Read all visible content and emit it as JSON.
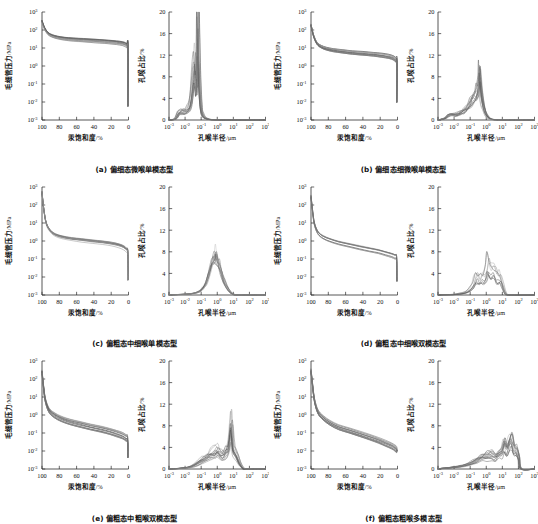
{
  "figure": {
    "panel_count": 6,
    "style": "grayscale multi-sample curves"
  },
  "axes": {
    "pc": {
      "ylabel": "毛细管压力",
      "yunit": "/MPa",
      "xlabel": "汞饱和度",
      "xunit": "/%",
      "y_ticks": [
        "10³",
        "10²",
        "10¹",
        "10⁰",
        "10⁻¹",
        "10⁻²",
        "10⁻³"
      ],
      "y_sup": [
        "3",
        "2",
        "1",
        "0",
        "-1",
        "-2",
        "-3"
      ],
      "x_ticks": [
        "100",
        "80",
        "60",
        "40",
        "20",
        "0"
      ],
      "ylim_log": [
        -3,
        3
      ],
      "xlim": [
        100,
        0
      ]
    },
    "psd": {
      "ylabel": "孔喉占比",
      "yunit": "/%",
      "xlabel": "孔喉半径",
      "xunit": "/μm",
      "y_ticks": [
        "20",
        "16",
        "12",
        "8",
        "4",
        "0"
      ],
      "x_ticks": [
        "10⁻³",
        "10⁻²",
        "10⁻¹",
        "10⁰",
        "10¹",
        "10²",
        "10³"
      ],
      "x_sup": [
        "-3",
        "-2",
        "-1",
        "0",
        "1",
        "2",
        "3"
      ],
      "ylim": [
        0,
        20
      ],
      "xlim_log": [
        -3,
        3
      ]
    }
  },
  "colors": {
    "axis": "#2b2b2b",
    "curve_dark": "#4a4a4a",
    "curve_mid": "#777777",
    "curve_light": "#a6a6a6",
    "background": "#ffffff"
  },
  "panels": [
    {
      "id": "a",
      "caption": "(a) 偏细态微喉单模态型",
      "chart_data": {
        "type": "line",
        "title": "(a) 偏细态微喉单模态型",
        "subcharts": [
          {
            "type": "line",
            "name": "capillary-pressure-curve",
            "xlabel": "汞饱和度/%",
            "ylabel": "毛细管压力/MPa",
            "xlim": [
              100,
              0
            ],
            "ylim": [
              0.001,
              1000
            ],
            "yscale": "log",
            "n_samples": 12,
            "entry_pressure": 300,
            "plateau_pressure": 22,
            "tail_pressure": 12,
            "x": [
              100,
              97,
              93,
              88,
              82,
              74,
              64,
              52,
              40,
              28,
              18,
              10,
              5,
              2,
              0.6,
              0
            ],
            "values": [
              300,
              120,
              62,
              45,
              37,
              32,
              29,
              26,
              24,
              22,
              20,
              18,
              16,
              13,
              11,
              0.006
            ],
            "spread_log": 0.13
          },
          {
            "type": "line",
            "name": "pore-throat-distribution",
            "xlabel": "孔喉半径/μm",
            "ylabel": "孔喉占比/%",
            "xlim": [
              0.001,
              1000
            ],
            "ylim": [
              0,
              20
            ],
            "xscale": "log",
            "n_samples": 12,
            "modality": "unimodal",
            "peak_radius_um": 0.055,
            "peak_percent": 18.2,
            "secondary_peak_radius_um": 0.022,
            "secondary_peak_percent": 9.5,
            "x_log": [
              -2.6,
              -2.4,
              -2.2,
              -2.0,
              -1.85,
              -1.7,
              -1.6,
              -1.5,
              -1.4,
              -1.3,
              -1.25,
              -1.2,
              -1.1,
              -1.0,
              -0.9,
              -0.8,
              -0.6,
              -0.3,
              0.2,
              1.0
            ],
            "values": [
              0.2,
              1.3,
              1.6,
              1.5,
              1.8,
              2.6,
              4.4,
              7.5,
              9.5,
              6.0,
              9.0,
              18.2,
              7.0,
              2.2,
              1.0,
              0.5,
              0.2,
              0.05,
              0.0,
              0.0
            ]
          }
        ]
      }
    },
    {
      "id": "b",
      "caption": "(b) 偏细态细微喉单模态型",
      "chart_data": {
        "type": "line",
        "title": "(b) 偏细态细微喉单模态型",
        "subcharts": [
          {
            "type": "line",
            "name": "capillary-pressure-curve",
            "xlabel": "汞饱和度/%",
            "ylabel": "毛细管压力/MPa",
            "xlim": [
              100,
              0
            ],
            "ylim": [
              0.001,
              1000
            ],
            "yscale": "log",
            "n_samples": 12,
            "entry_pressure": 180,
            "plateau_pressure": 6,
            "tail_pressure": 2,
            "x": [
              100,
              97,
              93,
              88,
              82,
              74,
              64,
              52,
              40,
              28,
              18,
              10,
              5,
              2,
              0.6,
              0
            ],
            "values": [
              180,
              45,
              17,
              11,
              8.5,
              7.0,
              6.0,
              5.2,
              4.6,
              4.1,
              3.6,
              3.1,
              2.6,
              2.0,
              1.5,
              0.01
            ],
            "spread_log": 0.16
          },
          {
            "type": "line",
            "name": "pore-throat-distribution",
            "xlabel": "孔喉半径/μm",
            "ylabel": "孔喉占比/%",
            "xlim": [
              0.001,
              1000
            ],
            "ylim": [
              0,
              20
            ],
            "xscale": "log",
            "n_samples": 12,
            "modality": "unimodal",
            "peak_radius_um": 0.33,
            "peak_percent": 8.3,
            "x_log": [
              -2.6,
              -2.4,
              -2.2,
              -2.0,
              -1.8,
              -1.6,
              -1.4,
              -1.2,
              -1.0,
              -0.85,
              -0.7,
              -0.6,
              -0.5,
              -0.45,
              -0.4,
              -0.3,
              -0.15,
              0.0,
              0.2,
              0.5,
              1.0
            ],
            "values": [
              0.3,
              0.8,
              1.0,
              0.9,
              1.0,
              1.3,
              1.7,
              2.2,
              3.0,
              3.6,
              4.3,
              5.0,
              6.2,
              8.3,
              6.4,
              4.0,
              2.0,
              0.8,
              0.25,
              0.05,
              0.0
            ]
          }
        ]
      }
    },
    {
      "id": "c",
      "caption": "(c) 偏粗态中细喉单模态型",
      "chart_data": {
        "type": "line",
        "title": "(c) 偏粗态中细喉单模态型",
        "subcharts": [
          {
            "type": "line",
            "name": "capillary-pressure-curve",
            "xlabel": "汞饱和度/%",
            "ylabel": "毛细管压力/MPa",
            "xlim": [
              100,
              0
            ],
            "ylim": [
              0.001,
              1000
            ],
            "yscale": "log",
            "n_samples": 10,
            "entry_pressure": 500,
            "plateau_pressure": 1.0,
            "tail_pressure": 0.25,
            "x": [
              100,
              98,
              95,
              90,
              84,
              76,
              66,
              54,
              42,
              30,
              20,
              12,
              6,
              2.5,
              0.8,
              0
            ],
            "values": [
              500,
              60,
              9,
              3.4,
              2.1,
              1.6,
              1.3,
              1.1,
              0.95,
              0.82,
              0.7,
              0.58,
              0.45,
              0.33,
              0.22,
              0.007
            ],
            "spread_log": 0.1
          },
          {
            "type": "line",
            "name": "pore-throat-distribution",
            "xlabel": "孔喉半径/μm",
            "ylabel": "孔喉占比/%",
            "xlim": [
              0.001,
              1000
            ],
            "ylim": [
              0,
              20
            ],
            "xscale": "log",
            "n_samples": 10,
            "modality": "unimodal",
            "peak_radius_um": 0.62,
            "peak_percent": 6.6,
            "x_log": [
              -2.6,
              -2.2,
              -1.8,
              -1.4,
              -1.1,
              -0.9,
              -0.7,
              -0.5,
              -0.35,
              -0.2,
              -0.1,
              0.0,
              0.1,
              0.25,
              0.4,
              0.6,
              0.8,
              1.0,
              1.3
            ],
            "values": [
              0.05,
              0.1,
              0.15,
              0.3,
              0.6,
              1.1,
              2.0,
              3.4,
              4.8,
              6.0,
              6.6,
              6.0,
              5.0,
              3.6,
              2.4,
              1.3,
              0.5,
              0.15,
              0.0
            ]
          }
        ]
      }
    },
    {
      "id": "d",
      "caption": "(d) 偏粗态中细喉双模态型",
      "chart_data": {
        "type": "line",
        "title": "(d) 偏粗态中细喉双模态型",
        "subcharts": [
          {
            "type": "line",
            "name": "capillary-pressure-curve",
            "xlabel": "汞饱和度/%",
            "ylabel": "毛细管压力/MPa",
            "xlim": [
              100,
              0
            ],
            "ylim": [
              0.001,
              1000
            ],
            "yscale": "log",
            "n_samples": 8,
            "entry_pressure": 300,
            "plateau_pressure": 0.8,
            "tail_pressure": 0.12,
            "x": [
              100,
              98,
              96,
              92,
              86,
              78,
              68,
              56,
              44,
              32,
              22,
              14,
              7,
              3,
              1,
              0
            ],
            "values": [
              300,
              40,
              9,
              3.0,
              1.7,
              1.15,
              0.82,
              0.6,
              0.45,
              0.34,
              0.27,
              0.21,
              0.17,
              0.14,
              0.11,
              0.006
            ],
            "spread_log": 0.14
          },
          {
            "type": "line",
            "name": "pore-throat-distribution",
            "xlabel": "孔喉半径/μm",
            "ylabel": "孔喉占比/%",
            "xlim": [
              0.001,
              1000
            ],
            "ylim": [
              0,
              20
            ],
            "xscale": "log",
            "n_samples": 8,
            "modality": "bimodal",
            "peak_radius_um": 1.2,
            "peak_percent": 5.8,
            "secondary_peak_radius_um": 0.25,
            "secondary_peak_percent": 3.2,
            "x_log": [
              -2.4,
              -2.0,
              -1.6,
              -1.2,
              -0.9,
              -0.75,
              -0.6,
              -0.45,
              -0.3,
              -0.15,
              0.0,
              0.1,
              0.25,
              0.4,
              0.55,
              0.7,
              0.85,
              1.0,
              1.2,
              1.5
            ],
            "values": [
              0.05,
              0.1,
              0.25,
              0.6,
              1.4,
              2.3,
              3.2,
              2.6,
              3.4,
              3.0,
              4.3,
              5.8,
              4.2,
              4.6,
              4.0,
              3.2,
              3.4,
              2.0,
              0.3,
              0.0
            ]
          }
        ]
      }
    },
    {
      "id": "e",
      "caption": "(e) 偏粗态中粗喉双模态型",
      "chart_data": {
        "type": "line",
        "title": "(e) 偏粗态中粗喉双模态型",
        "subcharts": [
          {
            "type": "line",
            "name": "capillary-pressure-curve",
            "xlabel": "汞饱和度/%",
            "ylabel": "毛细管压力/MPa",
            "xlim": [
              100,
              0
            ],
            "ylim": [
              0.001,
              1000
            ],
            "yscale": "log",
            "n_samples": 14,
            "entry_pressure": 250,
            "plateau_pressure": 0.3,
            "tail_pressure": 0.035,
            "x": [
              100,
              98,
              96,
              92,
              86,
              78,
              68,
              56,
              44,
              32,
              22,
              14,
              7,
              3,
              1,
              0
            ],
            "values": [
              250,
              30,
              6.5,
              1.9,
              1.0,
              0.62,
              0.42,
              0.3,
              0.22,
              0.165,
              0.125,
              0.095,
              0.072,
              0.055,
              0.042,
              0.0045
            ],
            "spread_log": 0.22
          },
          {
            "type": "line",
            "name": "pore-throat-distribution",
            "xlabel": "孔喉半径/μm",
            "ylabel": "孔喉占比/%",
            "xlim": [
              0.001,
              1000
            ],
            "ylim": [
              0,
              20
            ],
            "xscale": "log",
            "n_samples": 14,
            "modality": "bimodal",
            "peak_radius_um": 8.0,
            "peak_percent": 8.0,
            "secondary_peak_radius_um": 1.0,
            "secondary_peak_percent": 3.4,
            "x_log": [
              -2.6,
              -2.2,
              -1.8,
              -1.5,
              -1.2,
              -0.9,
              -0.6,
              -0.35,
              -0.1,
              0.05,
              0.2,
              0.4,
              0.6,
              0.75,
              0.9,
              1.0,
              1.1,
              1.25,
              1.4,
              1.6,
              1.8
            ],
            "values": [
              0.05,
              0.15,
              0.3,
              0.6,
              1.1,
              1.7,
              2.3,
              2.8,
              3.2,
              3.4,
              2.9,
              2.6,
              3.6,
              4.6,
              8.0,
              4.4,
              3.3,
              2.4,
              1.2,
              0.25,
              0.0
            ]
          }
        ]
      }
    },
    {
      "id": "f",
      "caption": "(f) 偏粗态粗喉多模态型",
      "chart_data": {
        "type": "line",
        "title": "(f) 偏粗态粗喉多模态型",
        "subcharts": [
          {
            "type": "line",
            "name": "capillary-pressure-curve",
            "xlabel": "汞饱和度/%",
            "ylabel": "毛细管压力/MPa",
            "xlim": [
              100,
              0
            ],
            "ylim": [
              0.001,
              1000
            ],
            "yscale": "log",
            "n_samples": 14,
            "entry_pressure": 300,
            "plateau_pressure": 0.15,
            "tail_pressure": 0.011,
            "x": [
              100,
              98,
              96,
              92,
              86,
              78,
              68,
              56,
              44,
              32,
              22,
              14,
              7,
              3,
              1,
              0
            ],
            "values": [
              300,
              40,
              7.0,
              1.6,
              0.72,
              0.38,
              0.22,
              0.145,
              0.095,
              0.062,
              0.042,
              0.029,
              0.021,
              0.016,
              0.013,
              0.0105
            ],
            "spread_log": 0.2
          },
          {
            "type": "line",
            "name": "pore-throat-distribution",
            "xlabel": "孔喉半径/μm",
            "ylabel": "孔喉占比/%",
            "xlim": [
              0.001,
              1000
            ],
            "ylim": [
              0,
              20
            ],
            "xscale": "log",
            "n_samples": 14,
            "modality": "multimodal",
            "peak_radius_um": 25.0,
            "peak_percent": 5.2,
            "secondary_peak_radius_um": 2.0,
            "secondary_peak_percent": 2.6,
            "x_log": [
              -2.8,
              -2.4,
              -2.0,
              -1.6,
              -1.2,
              -0.9,
              -0.6,
              -0.3,
              0.0,
              0.3,
              0.55,
              0.75,
              0.95,
              1.1,
              1.25,
              1.4,
              1.55,
              1.7,
              1.85,
              2.0,
              2.15
            ],
            "values": [
              0.1,
              0.2,
              0.35,
              0.5,
              0.8,
              1.2,
              1.7,
              2.1,
              2.4,
              2.6,
              2.2,
              2.8,
              3.2,
              4.4,
              3.4,
              4.6,
              5.2,
              3.6,
              3.2,
              2.0,
              0.0
            ]
          }
        ]
      }
    }
  ]
}
